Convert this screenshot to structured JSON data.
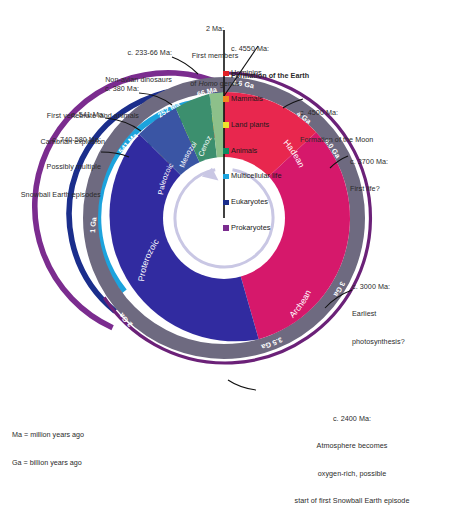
{
  "figure": {
    "type": "radial-timeline"
  },
  "legend": {
    "line1": "Ma = million years ago",
    "line2": "Ga = billion years ago"
  },
  "annotations": [
    {
      "id": "formation-earth",
      "lines": [
        "c. 4550 Ma:",
        "Formation of the Earth"
      ],
      "bold_line": 1
    },
    {
      "id": "formation-moon",
      "lines": [
        "c. 4500 Ma:",
        "Formation of the Moon"
      ],
      "bold_line": -1
    },
    {
      "id": "homo-genus",
      "lines": [
        "2 Ma:",
        "First members",
        "of Homo genus"
      ],
      "italic_word": "Homo"
    },
    {
      "id": "dinosaurs",
      "lines": [
        "c. 233-66 Ma:",
        "Non-avian dinosaurs"
      ]
    },
    {
      "id": "vertebrate-land-animals",
      "lines": [
        "c. 380 Ma:",
        "First vertebrate land animals"
      ]
    },
    {
      "id": "cambrian-explosion",
      "lines": [
        "c. 541 Ma:",
        "Cambrian explosion"
      ]
    },
    {
      "id": "snowball-earth-neoproterozoic",
      "lines": [
        "c. 740-580 Ma:",
        "Possibly multiple",
        "Snowball Earth episodes"
      ]
    },
    {
      "id": "first-life",
      "lines": [
        "c. 3700 Ma:",
        "First life?"
      ]
    },
    {
      "id": "earliest-photosynthesis",
      "lines": [
        "c. 3000 Ma:",
        "Earliest",
        "photosynthesis?"
      ]
    },
    {
      "id": "great-oxidation",
      "lines": [
        "c. 2400 Ma:",
        "Atmosphere becomes",
        "oxygen-rich, possible",
        "start of first Snowball Earth episode"
      ]
    }
  ],
  "life_bands": [
    {
      "label": "Hominins",
      "color": "#E02127"
    },
    {
      "label": "Mammals",
      "color": "#F08A1E"
    },
    {
      "label": "Land plants",
      "color": "#EDE22B"
    },
    {
      "label": "Animals",
      "color": "#0E8A5F"
    },
    {
      "label": "Multicellular life",
      "color": "#1CA3DD"
    },
    {
      "label": "Eukaryotes",
      "color": "#1B2E8C"
    },
    {
      "label": "Prokaryotes",
      "color": "#7B2C8F"
    }
  ],
  "eons": [
    {
      "label": "Hadean",
      "color": "#E8274E",
      "start_ga": 4.6,
      "end_ga": 4.0
    },
    {
      "label": "Archean",
      "color": "#D6186B",
      "start_ga": 4.0,
      "end_ga": 2.5
    },
    {
      "label": "Proterozoic",
      "color": "#312BA0",
      "start_ga": 2.5,
      "end_ga": 0.541
    },
    {
      "label": "Phanerozoic",
      "color": "#3D5BA9",
      "start_ga": 0.541,
      "end_ga": 0.0
    }
  ],
  "eras": [
    {
      "label": "Paleozoic",
      "color": "#3A55A4",
      "start_ma": 541,
      "end_ma": 252
    },
    {
      "label": "Mesozoic",
      "color": "#3C8F6E",
      "start_ma": 252,
      "end_ma": 66
    },
    {
      "label": "Cenozoic",
      "color": "#8DC08A",
      "start_ma": 66,
      "end_ma": 0
    }
  ],
  "ticks": [
    {
      "label": "4.6 Ga",
      "ga": 4.6
    },
    {
      "label": "4 Ga",
      "ga": 4.0
    },
    {
      "label": "4.0 Ga",
      "ga": 4.0
    },
    {
      "label": "3.5 Ga",
      "ga": 3.5
    },
    {
      "label": "3 Ga",
      "ga": 3.0
    },
    {
      "label": "2 Ga",
      "ga": 2.0
    },
    {
      "label": "1 Ga",
      "ga": 1.0
    },
    {
      "label": "541 Ma",
      "ga": 0.541
    },
    {
      "label": "252 Ma",
      "ga": 0.252
    },
    {
      "label": "66 Ma",
      "ga": 0.066
    }
  ],
  "chart_data": {
    "type": "pie",
    "total_span_ga": 4.6,
    "direction": "clockwise-from-top-into-past",
    "categories": [
      "Hadean",
      "Archean",
      "Proterozoic",
      "Phanerozoic"
    ],
    "values": [
      0.6,
      1.5,
      1.959,
      0.541
    ],
    "unit": "Ga",
    "legend": "Ma = million years ago; Ga = billion years ago"
  }
}
